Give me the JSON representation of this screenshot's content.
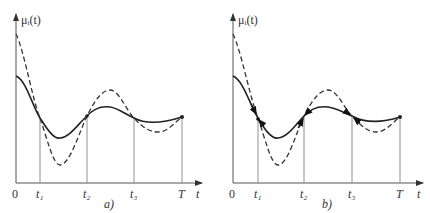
{
  "panels": [
    {
      "id": "a",
      "caption": "a)",
      "y_label": "μᵢ(t)",
      "x_label": "t",
      "origin_label": "0",
      "ticks": [
        "t₁",
        "t₂",
        "t₃",
        "T"
      ],
      "arrows": false
    },
    {
      "id": "b",
      "caption": "b)",
      "y_label": "μᵢ(t)",
      "x_label": "t",
      "origin_label": "0",
      "ticks": [
        "t₁",
        "t₂",
        "t₃",
        "T"
      ],
      "arrows": true
    }
  ],
  "colors": {
    "axis": "#555555",
    "solid_curve": "#222222",
    "dashed_curve": "#333333",
    "gridline": "#777777"
  }
}
